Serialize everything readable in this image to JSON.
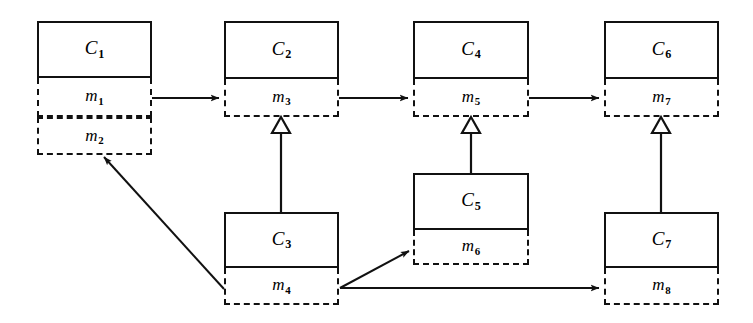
{
  "figure": {
    "kind": "class-call-graph",
    "background_color": "#ffffff",
    "ink_color": "#111111",
    "width": 753,
    "height": 323
  },
  "classes": [
    {
      "id": "c1",
      "name": "C",
      "name_sub": "1",
      "x": 37,
      "y": 21,
      "w": 115,
      "header_h": 57,
      "methods": [
        {
          "id": "m1",
          "name": "m",
          "name_sub": "1",
          "h": 39
        },
        {
          "id": "m2",
          "name": "m",
          "name_sub": "2",
          "h": 38
        }
      ]
    },
    {
      "id": "c2",
      "name": "C",
      "name_sub": "2",
      "x": 224,
      "y": 21,
      "w": 115,
      "header_h": 58,
      "methods": [
        {
          "id": "m3",
          "name": "m",
          "name_sub": "3",
          "h": 38
        }
      ]
    },
    {
      "id": "c4",
      "name": "C",
      "name_sub": "4",
      "x": 413,
      "y": 21,
      "w": 116,
      "header_h": 58,
      "methods": [
        {
          "id": "m5",
          "name": "m",
          "name_sub": "5",
          "h": 38
        }
      ]
    },
    {
      "id": "c6",
      "name": "C",
      "name_sub": "6",
      "x": 604,
      "y": 21,
      "w": 115,
      "header_h": 58,
      "methods": [
        {
          "id": "m7",
          "name": "m",
          "name_sub": "7",
          "h": 38
        }
      ]
    },
    {
      "id": "c5",
      "name": "C",
      "name_sub": "5",
      "x": 413,
      "y": 173,
      "w": 116,
      "header_h": 57,
      "methods": [
        {
          "id": "m6",
          "name": "m",
          "name_sub": "6",
          "h": 35
        }
      ]
    },
    {
      "id": "c3",
      "name": "C",
      "name_sub": "3",
      "x": 224,
      "y": 212,
      "w": 115,
      "header_h": 56,
      "methods": [
        {
          "id": "m4",
          "name": "m",
          "name_sub": "4",
          "h": 37
        }
      ]
    },
    {
      "id": "c7",
      "name": "C",
      "name_sub": "7",
      "x": 604,
      "y": 212,
      "w": 115,
      "header_h": 56,
      "methods": [
        {
          "id": "m8",
          "name": "m",
          "name_sub": "8",
          "h": 37
        }
      ]
    }
  ],
  "edges": [
    {
      "id": "e-m1-m3",
      "kind": "call",
      "from": "m1",
      "to": "m3",
      "points": "152,98 219,98",
      "arrowhead": "solid"
    },
    {
      "id": "e-m3-m5",
      "kind": "call",
      "from": "m3",
      "to": "m5",
      "points": "339,98 408,98",
      "arrowhead": "solid"
    },
    {
      "id": "e-m5-m7",
      "kind": "call",
      "from": "m5",
      "to": "m7",
      "points": "529,98 599,98",
      "arrowhead": "solid"
    },
    {
      "id": "e-m4-m2",
      "kind": "call",
      "from": "m4",
      "to": "m2",
      "points": "224,289 104,157",
      "arrowhead": "solid"
    },
    {
      "id": "e-m4-m6",
      "kind": "call",
      "from": "m4",
      "to": "m6",
      "points": "340,288 409,251",
      "arrowhead": "solid"
    },
    {
      "id": "e-m4-m8",
      "kind": "call",
      "from": "m4",
      "to": "m8",
      "points": "340,288 599,288",
      "arrowhead": "solid"
    },
    {
      "id": "e-c3-m3",
      "kind": "inheritance",
      "from": "c3",
      "to": "m3",
      "x": 281,
      "top_y": 117,
      "bottom_y": 212,
      "arrowhead": "hollow-triangle"
    },
    {
      "id": "e-c5-m5",
      "kind": "inheritance",
      "from": "c5",
      "to": "m5",
      "x": 471,
      "top_y": 117,
      "bottom_y": 173,
      "arrowhead": "hollow-triangle"
    },
    {
      "id": "e-c7-m7",
      "kind": "inheritance",
      "from": "c7",
      "to": "m7",
      "x": 661,
      "top_y": 117,
      "bottom_y": 212,
      "arrowhead": "hollow-triangle"
    }
  ]
}
